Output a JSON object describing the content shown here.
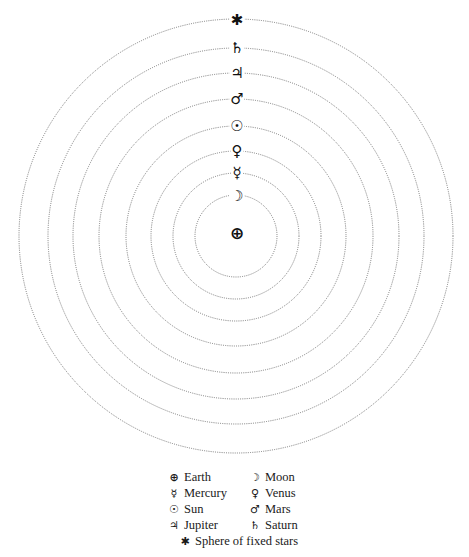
{
  "diagram": {
    "title": "",
    "center": [
      236,
      236
    ],
    "ring_color": "#777777",
    "spheres": [
      {
        "name": "Moon",
        "symbol": "☽",
        "radius": 41
      },
      {
        "name": "Mercury",
        "symbol": "☿",
        "radius": 63
      },
      {
        "name": "Venus",
        "symbol": "♀",
        "radius": 85
      },
      {
        "name": "Sun",
        "symbol": "☉",
        "radius": 110
      },
      {
        "name": "Mars",
        "symbol": "♂",
        "radius": 137
      },
      {
        "name": "Jupiter",
        "symbol": "♃",
        "radius": 163
      },
      {
        "name": "Saturn",
        "symbol": "♄",
        "radius": 188
      },
      {
        "name": "Sphere of fixed stars",
        "symbol": "✱",
        "radius": 217
      }
    ],
    "earth": {
      "name": "Earth",
      "symbol": "⊕"
    }
  },
  "legend": {
    "items": [
      {
        "symbol": "⊕",
        "label": "Earth"
      },
      {
        "symbol": "☽",
        "label": "Moon"
      },
      {
        "symbol": "☿",
        "label": "Mercury"
      },
      {
        "symbol": "♀",
        "label": "Venus"
      },
      {
        "symbol": "☉",
        "label": "Sun"
      },
      {
        "symbol": "♂",
        "label": "Mars"
      },
      {
        "symbol": "♃",
        "label": "Jupiter"
      },
      {
        "symbol": "♄",
        "label": "Saturn"
      },
      {
        "symbol": "✱",
        "label": "Sphere of fixed stars"
      }
    ]
  }
}
